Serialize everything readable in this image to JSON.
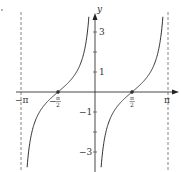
{
  "chart_data": {
    "type": "line",
    "title": "",
    "function": "y = -cot x",
    "xlabel": "",
    "ylabel": "y",
    "xlim": [
      -3.1416,
      3.1416
    ],
    "ylim": [
      -3.9,
      4
    ],
    "x_ticks": [
      {
        "value": -3.1416,
        "label": "−π"
      },
      {
        "value": -1.5708,
        "label": "−π/2"
      },
      {
        "value": 1.5708,
        "label": "π/2"
      },
      {
        "value": 3.1416,
        "label": "π"
      }
    ],
    "y_ticks": [
      {
        "value": 3,
        "label": "3"
      },
      {
        "value": 2,
        "label": ""
      },
      {
        "value": 1,
        "label": "1"
      },
      {
        "value": -1,
        "label": "−1"
      },
      {
        "value": -2,
        "label": ""
      },
      {
        "value": -3,
        "label": "−3"
      }
    ],
    "asymptotes": [
      -3.1416,
      0,
      3.1416
    ],
    "marked_points": [
      {
        "x": -1.5708,
        "y": 0
      },
      {
        "x": 1.5708,
        "y": 0
      }
    ],
    "grid": false,
    "legend": null
  },
  "labels": {
    "y_axis": "y",
    "x_neg_pi": "−π",
    "x_pi": "π",
    "x_neg_half_pi_num": "π",
    "x_neg_half_pi_den": "2",
    "x_half_pi_num": "π",
    "x_half_pi_den": "2",
    "minus": "−",
    "y3": "3",
    "y1": "1",
    "ym1": "−1",
    "ym3": "−3"
  }
}
